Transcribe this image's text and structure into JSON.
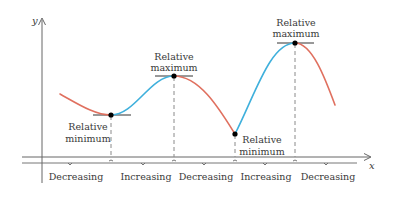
{
  "axes": {
    "x_label": "x",
    "y_label": "y"
  },
  "colors": {
    "decreasing": "#e0705f",
    "increasing": "#3fb0dc",
    "axis": "#555555",
    "dash": "#8a8a8a",
    "point": "#000000"
  },
  "annotations": {
    "rel_min_1": {
      "line1": "Relative",
      "line2": "minimum"
    },
    "rel_max_1": {
      "line1": "Relative",
      "line2": "maximum"
    },
    "rel_min_2": {
      "line1": "Relative",
      "line2": "minimum"
    },
    "rel_max_2": {
      "line1": "Relative",
      "line2": "maximum"
    }
  },
  "intervals": [
    {
      "label": "Decreasing"
    },
    {
      "label": "Increasing"
    },
    {
      "label": "Decreasing"
    },
    {
      "label": "Increasing"
    },
    {
      "label": "Decreasing"
    }
  ]
}
